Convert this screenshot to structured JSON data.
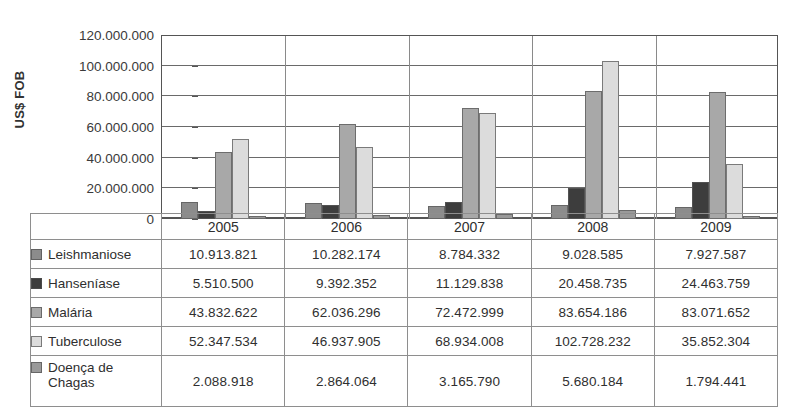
{
  "figure": {
    "title_remnant": "",
    "y_axis_title": "US$ FOB"
  },
  "chart_data": {
    "type": "bar",
    "title": "",
    "xlabel": "",
    "ylabel": "US$ FOB",
    "ylim": [
      0,
      120000000
    ],
    "yticks": [
      "0",
      "20.000.000",
      "40.000.000",
      "60.000.000",
      "80.000.000",
      "100.000.000",
      "120.000.000"
    ],
    "ytick_values": [
      0,
      20000000,
      40000000,
      60000000,
      80000000,
      100000000,
      120000000
    ],
    "grid": true,
    "legend_position": "table-below",
    "categories": [
      "2005",
      "2006",
      "2007",
      "2008",
      "2009"
    ],
    "series": [
      {
        "name": "Leishmaniose",
        "color": "#8c8c8c",
        "values": [
          10913821,
          10282174,
          8784332,
          9028585,
          7927587
        ],
        "labels": [
          "10.913.821",
          "10.282.174",
          "8.784.332",
          "9.028.585",
          "7.927.587"
        ]
      },
      {
        "name": "Hanseníase",
        "color": "#3d3d3d",
        "values": [
          5510500,
          9392352,
          11129838,
          20458735,
          24463759
        ],
        "labels": [
          "5.510.500",
          "9.392.352",
          "11.129.838",
          "20.458.735",
          "24.463.759"
        ]
      },
      {
        "name": "Malária",
        "color": "#a8a8a8",
        "values": [
          43832622,
          62036296,
          72472999,
          83654186,
          83071652
        ],
        "labels": [
          "43.832.622",
          "62.036.296",
          "72.472.999",
          "83.654.186",
          "83.071.652"
        ]
      },
      {
        "name": "Tuberculose",
        "color": "#dcdcdc",
        "values": [
          52347534,
          46937905,
          68934008,
          102728232,
          35852304
        ],
        "labels": [
          "52.347.534",
          "46.937.905",
          "68.934.008",
          "102.728.232",
          "35.852.304"
        ]
      },
      {
        "name": "Doença de Chagas",
        "color": "#9a9a9a",
        "values": [
          2088918,
          2864064,
          3165790,
          5680184,
          1794441
        ],
        "labels": [
          "2.088.918",
          "2.864.064",
          "3.165.790",
          "5.680.184",
          "1.794.441"
        ]
      }
    ]
  },
  "table": {
    "corner_label": "",
    "year_headers": [
      "2005",
      "2006",
      "2007",
      "2008",
      "2009"
    ],
    "rows": [
      {
        "label": "Leishmaniose",
        "label_line2": "",
        "swatch": "#8c8c8c",
        "values": [
          "10.913.821",
          "10.282.174",
          "8.784.332",
          "9.028.585",
          "7.927.587"
        ]
      },
      {
        "label": "Hanseníase",
        "label_line2": "",
        "swatch": "#3d3d3d",
        "values": [
          "5.510.500",
          "9.392.352",
          "11.129.838",
          "20.458.735",
          "24.463.759"
        ]
      },
      {
        "label": "Malária",
        "label_line2": "",
        "swatch": "#a8a8a8",
        "values": [
          "43.832.622",
          "62.036.296",
          "72.472.999",
          "83.654.186",
          "83.071.652"
        ]
      },
      {
        "label": "Tuberculose",
        "label_line2": "",
        "swatch": "#dcdcdc",
        "values": [
          "52.347.534",
          "46.937.905",
          "68.934.008",
          "102.728.232",
          "35.852.304"
        ]
      },
      {
        "label": "Doença de",
        "label_line2": "Chagas",
        "swatch": "#9a9a9a",
        "values": [
          "2.088.918",
          "2.864.064",
          "3.165.790",
          "5.680.184",
          "1.794.441"
        ]
      }
    ]
  }
}
